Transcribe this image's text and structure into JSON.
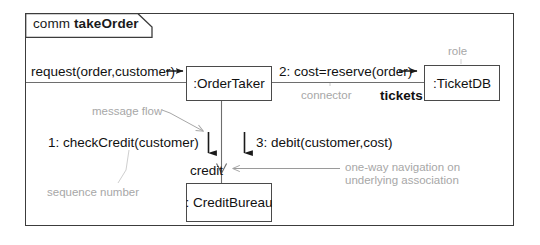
{
  "diagram": {
    "kind": "uml-communication-diagram",
    "frame": {
      "keyword": "comm",
      "name": "takeOrder"
    },
    "lifelines": [
      {
        "id": "ordertaker",
        "label": ":OrderTaker"
      },
      {
        "id": "ticketdb",
        "label": ":TicketDB"
      },
      {
        "id": "creditbureau",
        "label": ": CreditBureau"
      }
    ],
    "messages": [
      {
        "id": "request",
        "label": "request(order,customer)"
      },
      {
        "id": "cost",
        "label": "2: cost=reserve(order)"
      },
      {
        "id": "check",
        "label": "1: checkCredit(customer)"
      },
      {
        "id": "debit",
        "label": "3: debit(customer,cost)"
      }
    ],
    "roles": [
      {
        "id": "tickets",
        "label": "tickets"
      },
      {
        "id": "credit",
        "label": "credit"
      }
    ],
    "annotations": [
      {
        "id": "role",
        "label": "role"
      },
      {
        "id": "connector",
        "label": "connector"
      },
      {
        "id": "msgflow",
        "label": "message flow"
      },
      {
        "id": "seqnum",
        "label": "sequence number"
      },
      {
        "id": "oneway_1",
        "label": "one-way navigation on"
      },
      {
        "id": "oneway_2",
        "label": "underlying association"
      }
    ],
    "colors": {
      "frame_stroke": "#3c3c3c",
      "box_stroke": "#4a4a4a",
      "connector_stroke": "#6e6e6e",
      "message_arrow": "#1a1a1a",
      "annotation_text": "#a7a7a7",
      "body_text": "#111111",
      "background": "#ffffff"
    }
  }
}
